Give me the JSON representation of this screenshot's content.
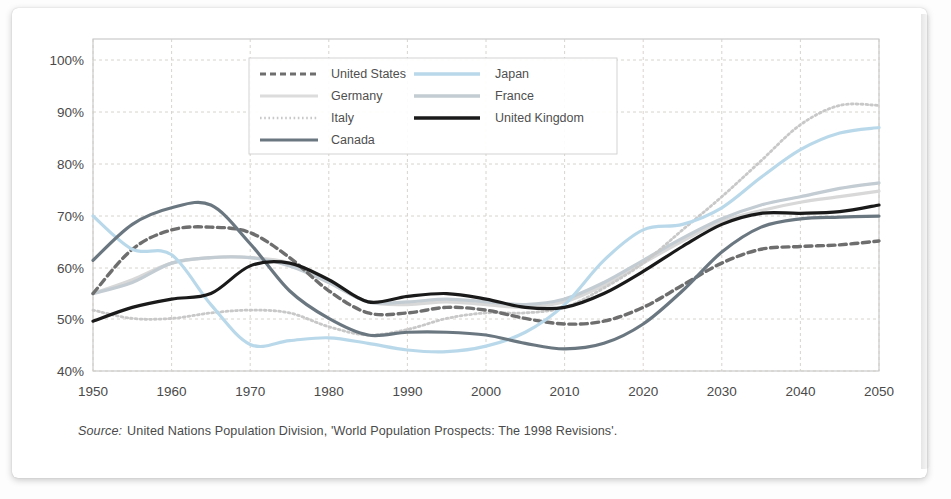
{
  "figure": {
    "source_prefix": "Source:",
    "source_text": "United Nations Population Division, 'World Population Prospects: The 1998 Revisions'."
  },
  "axes": {
    "y_ticks": [
      "100%",
      "90%",
      "80%",
      "70%",
      "60%",
      "50%",
      "40%"
    ],
    "x_ticks": [
      "1950",
      "1960",
      "1970",
      "1980",
      "1990",
      "2000",
      "2010",
      "2020",
      "2030",
      "2040",
      "2050"
    ]
  },
  "legend": {
    "items": [
      {
        "label": "United States",
        "color": "#6e6e6e",
        "style": "dashed"
      },
      {
        "label": "Japan",
        "color": "#b9d9ea",
        "style": "solid"
      },
      {
        "label": "Germany",
        "color": "#d8d8d8",
        "style": "solid"
      },
      {
        "label": "France",
        "color": "#c3ccd2",
        "style": "solid"
      },
      {
        "label": "Italy",
        "color": "#c8c8c8",
        "style": "dotted"
      },
      {
        "label": "United Kingdom",
        "color": "#1a1a1a",
        "style": "solid"
      },
      {
        "label": "Canada",
        "color": "#6b7780",
        "style": "solid"
      }
    ]
  },
  "chart_data": {
    "type": "line",
    "title": "",
    "subtitle": "",
    "xlabel": "",
    "ylabel": "",
    "xlim": [
      1950,
      2050
    ],
    "ylim": [
      40,
      100
    ],
    "grid": true,
    "legend_position": "top-center-inside",
    "x": [
      1950,
      1955,
      1960,
      1965,
      1970,
      1975,
      1980,
      1985,
      1990,
      1995,
      2000,
      2005,
      2010,
      2015,
      2020,
      2025,
      2030,
      2035,
      2040,
      2045,
      2050
    ],
    "series": [
      {
        "name": "United States",
        "color": "#6e6e6e",
        "style": "dashed",
        "values": [
          54.0,
          62.0,
          65.5,
          66.0,
          65.0,
          60.5,
          54.5,
          50.5,
          50.5,
          51.5,
          51.0,
          49.5,
          48.5,
          49.0,
          51.5,
          55.5,
          59.5,
          62.0,
          62.5,
          62.8,
          63.5
        ]
      },
      {
        "name": "Japan",
        "color": "#b9d9ea",
        "style": "solid",
        "values": [
          68.0,
          62.0,
          61.0,
          52.0,
          44.8,
          45.5,
          46.0,
          45.0,
          43.8,
          43.5,
          44.5,
          47.0,
          52.0,
          60.0,
          65.5,
          66.5,
          69.5,
          75.0,
          80.0,
          83.0,
          84.0
        ]
      },
      {
        "name": "Germany",
        "color": "#d8d8d8",
        "style": "solid",
        "values": [
          54.0,
          56.5,
          59.5,
          60.5,
          60.5,
          59.5,
          56.0,
          52.5,
          52.0,
          52.5,
          52.0,
          51.5,
          52.5,
          55.5,
          59.5,
          63.5,
          67.0,
          69.0,
          70.5,
          71.5,
          72.5
        ]
      },
      {
        "name": "France",
        "color": "#c3ccd2",
        "style": "solid",
        "values": [
          54.0,
          56.0,
          59.5,
          60.5,
          60.5,
          59.0,
          56.0,
          52.5,
          52.5,
          53.0,
          52.5,
          52.0,
          53.0,
          56.0,
          60.0,
          64.0,
          67.5,
          70.0,
          71.5,
          73.0,
          74.0
        ]
      },
      {
        "name": "Italy",
        "color": "#c8c8c8",
        "style": "dotted",
        "values": [
          51.0,
          49.5,
          49.5,
          50.5,
          51.0,
          50.5,
          48.0,
          46.5,
          47.5,
          49.5,
          50.5,
          50.5,
          51.5,
          55.0,
          59.5,
          65.5,
          71.5,
          78.0,
          84.5,
          88.0,
          88.0
        ]
      },
      {
        "name": "United Kingdom",
        "color": "#1a1a1a",
        "style": "solid",
        "values": [
          49.0,
          51.5,
          53.0,
          54.0,
          59.0,
          59.5,
          56.5,
          52.5,
          53.5,
          54.0,
          53.0,
          51.5,
          51.5,
          54.0,
          58.0,
          62.5,
          66.5,
          68.5,
          68.5,
          68.8,
          70.0
        ]
      },
      {
        "name": "Canada",
        "color": "#6b7780",
        "style": "solid",
        "values": [
          60.0,
          66.5,
          69.5,
          70.0,
          63.0,
          54.5,
          49.5,
          46.5,
          47.0,
          47.0,
          46.5,
          45.0,
          44.0,
          45.0,
          48.5,
          54.5,
          61.5,
          66.0,
          67.5,
          67.8,
          68.0
        ]
      }
    ]
  }
}
